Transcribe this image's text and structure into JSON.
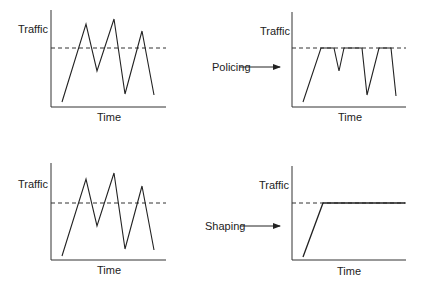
{
  "colors": {
    "line": "#222222",
    "background": "#ffffff"
  },
  "panels": [
    {
      "id": "original-top",
      "ylabel": "Traffic",
      "xlabel": "Time",
      "axis": {
        "x0": 51,
        "y0": 107,
        "top": 10,
        "right": 166
      },
      "threshold_y": 48,
      "points": "62,102 86,24 97,71 114,19 125,94 142,31 154,95"
    },
    {
      "id": "policed",
      "ylabel": "Traffic",
      "xlabel": "Time",
      "axis": {
        "x0": 292,
        "y0": 107,
        "top": 12,
        "right": 406
      },
      "threshold_y": 48,
      "points": "303,102 321,48 334,48 339,71 344,48 362,48 367,95 379,48 391,48 396,96"
    },
    {
      "id": "original-bottom",
      "ylabel": "Traffic",
      "xlabel": "Time",
      "axis": {
        "x0": 51,
        "y0": 260,
        "top": 163,
        "right": 166
      },
      "threshold_y": 203,
      "points": "62,256 86,179 97,226 114,173 125,249 142,186 154,250"
    },
    {
      "id": "shaped",
      "ylabel": "Traffic",
      "xlabel": "Time",
      "axis": {
        "x0": 292,
        "y0": 260,
        "top": 166,
        "right": 406
      },
      "threshold_y": 203,
      "points": "303,257 323,203 405,203"
    }
  ],
  "arrows": [
    {
      "label": "Policing",
      "y": 67
    },
    {
      "label": "Shaping",
      "y": 226
    }
  ]
}
